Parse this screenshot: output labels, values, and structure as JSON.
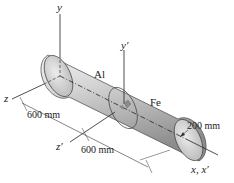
{
  "figure": {
    "axes": {
      "y": "y",
      "y_prime": "y′",
      "z": "z",
      "z_prime": "z′",
      "x": "x, x′"
    },
    "materials": {
      "segment_1": "Al",
      "segment_2": "Fe"
    },
    "dimensions": {
      "length_1": "600 mm",
      "length_2": "600 mm",
      "diameter": "200 mm"
    },
    "colors": {
      "cylinder_light": "#e6e6e6",
      "cylinder_dark": "#9a9a9a",
      "line": "#222222",
      "torque_arrow": "#888888"
    }
  }
}
